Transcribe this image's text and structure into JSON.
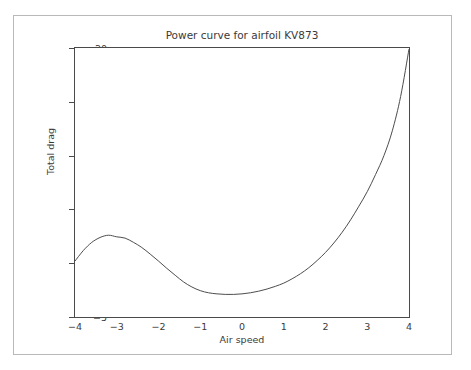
{
  "chart_data": {
    "type": "line",
    "title": "Power curve for airfoil KV873",
    "xlabel": "Air speed",
    "ylabel": "Total drag",
    "xlim": [
      -4,
      4
    ],
    "ylim": [
      -5,
      20
    ],
    "xticks": [
      "−4",
      "−3",
      "−2",
      "−1",
      "0",
      "1",
      "2",
      "3",
      "4"
    ],
    "xtick_values": [
      -4,
      -3,
      -2,
      -1,
      0,
      1,
      2,
      3,
      4
    ],
    "yticks": [
      "−5",
      "0",
      "5",
      "10",
      "15",
      "20"
    ],
    "ytick_values": [
      -5,
      0,
      5,
      10,
      15,
      20
    ],
    "grid": false,
    "legend": null,
    "series": [
      {
        "name": "Total drag",
        "color": "#4d4d4d",
        "x": [
          -4.0,
          -3.8,
          -3.6,
          -3.4,
          -3.2,
          -3.0,
          -2.8,
          -2.6,
          -2.4,
          -2.2,
          -2.0,
          -1.8,
          -1.6,
          -1.4,
          -1.2,
          -1.0,
          -0.8,
          -0.6,
          -0.4,
          -0.2,
          0.0,
          0.2,
          0.4,
          0.6,
          0.8,
          1.0,
          1.2,
          1.4,
          1.6,
          1.8,
          2.0,
          2.2,
          2.4,
          2.6,
          2.8,
          3.0,
          3.2,
          3.4,
          3.6,
          3.8,
          4.0
        ],
        "y": [
          0.2,
          1.18,
          1.93,
          2.39,
          2.6,
          2.45,
          2.33,
          1.94,
          1.46,
          0.85,
          0.2,
          -0.48,
          -1.12,
          -1.74,
          -2.21,
          -2.55,
          -2.75,
          -2.85,
          -2.9,
          -2.9,
          -2.85,
          -2.75,
          -2.6,
          -2.4,
          -2.15,
          -1.85,
          -1.45,
          -0.98,
          -0.42,
          0.25,
          1.0,
          1.88,
          2.88,
          4.02,
          5.3,
          6.65,
          8.25,
          10.0,
          12.3,
          15.5,
          19.9
        ]
      }
    ],
    "annotations": {
      "local_max": {
        "x": -2.7,
        "y": 2.6
      },
      "local_min": {
        "x": 0.3,
        "y": -2.9
      },
      "endpoint_left": {
        "x": -4,
        "y": 0.2
      },
      "endpoint_right": {
        "x": 4,
        "y": 20
      }
    }
  },
  "colors": {
    "background": "#ffffff",
    "axis": "#4a4a4a",
    "text": "#3a3a3a",
    "curve": "#4d4d4d",
    "outer_border": "#b9b9b9"
  }
}
